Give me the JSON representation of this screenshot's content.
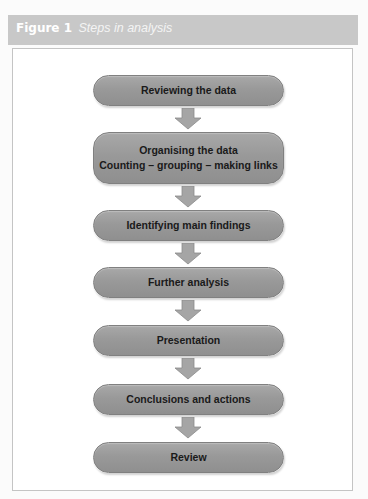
{
  "figure": {
    "number": "Figure 1",
    "caption": "Steps in analysis"
  },
  "steps": [
    {
      "label": "Reviewing the data"
    },
    {
      "label": "Organising the data",
      "sublabel": "Counting – grouping – making links"
    },
    {
      "label": "Identifying main findings"
    },
    {
      "label": "Further analysis"
    },
    {
      "label": "Presentation"
    },
    {
      "label": "Conclusions and actions"
    },
    {
      "label": "Review"
    }
  ],
  "colors": {
    "header_band": "#c8c8c8",
    "step_fill": "#999999",
    "arrow_fill": "#a5a5a5",
    "panel_border": "#c4c4c4"
  }
}
